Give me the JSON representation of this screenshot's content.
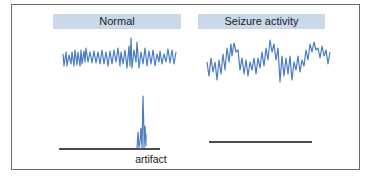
{
  "panels": [
    {
      "id": "normal",
      "label": "Normal"
    },
    {
      "id": "seizure",
      "label": "Seizure activity"
    }
  ],
  "annotations": {
    "artifact": "artifact"
  },
  "colors": {
    "trace": "#4a7cc4",
    "label_bg": "#c9d9ea",
    "baseline": "#111111",
    "frame": "#6b6b6b"
  }
}
